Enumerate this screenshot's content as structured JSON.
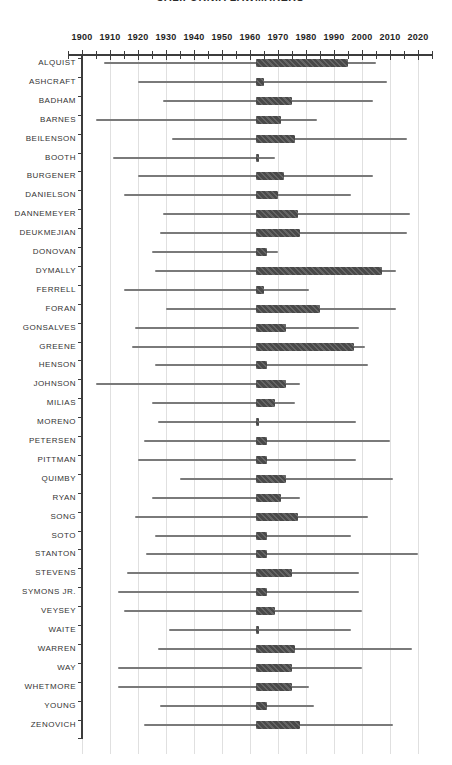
{
  "title": "CALIFORNIA LAWMAKERS",
  "chart_data": {
    "type": "bar",
    "subtype": "horizontal-range-timeline",
    "title": "CALIFORNIA LAWMAKERS",
    "title_clipped_at_top": true,
    "xlabel": "",
    "ylabel": "",
    "legend_position": "none",
    "grid": "vertical gridlines at each decade",
    "x_axis": {
      "min": 1895,
      "max": 2025,
      "minor_tick_step": 5,
      "major_tick_step": 10,
      "tick_labels": [
        "1900",
        "1910",
        "1920",
        "1930",
        "1940",
        "1950",
        "1960",
        "1970",
        "1980",
        "1990",
        "2000",
        "2010",
        "2020"
      ]
    },
    "series_meaning": [
      {
        "name": "lifespan",
        "style": "thin-gray-line"
      },
      {
        "name": "tenure",
        "style": "thick-dark-bar"
      }
    ],
    "colors": {
      "tenure_bar": "#4d4d4d",
      "lifespan_line": "#7a7a7a",
      "gridline": "#e0e0e0",
      "axis": "#3c3c3c",
      "row_label": "#333333",
      "background": "#ffffff"
    },
    "rows": [
      {
        "name": "ALQUIST",
        "lifespan": [
          1908,
          2005
        ],
        "tenure": [
          1962,
          1995
        ]
      },
      {
        "name": "ASHCRAFT",
        "lifespan": [
          1920,
          2009
        ],
        "tenure": [
          1962,
          1965
        ]
      },
      {
        "name": "BADHAM",
        "lifespan": [
          1929,
          2004
        ],
        "tenure": [
          1962,
          1975
        ]
      },
      {
        "name": "BARNES",
        "lifespan": [
          1905,
          1984
        ],
        "tenure": [
          1962,
          1971
        ]
      },
      {
        "name": "BEILENSON",
        "lifespan": [
          1932,
          2016
        ],
        "tenure": [
          1962,
          1976
        ]
      },
      {
        "name": "BOOTH",
        "lifespan": [
          1911,
          1969
        ],
        "tenure": [
          1962,
          1963
        ]
      },
      {
        "name": "BURGENER",
        "lifespan": [
          1920,
          2004
        ],
        "tenure": [
          1962,
          1972
        ]
      },
      {
        "name": "DANIELSON",
        "lifespan": [
          1915,
          1996
        ],
        "tenure": [
          1962,
          1970
        ]
      },
      {
        "name": "DANNEMEYER",
        "lifespan": [
          1929,
          2017
        ],
        "tenure": [
          1962,
          1977
        ]
      },
      {
        "name": "DEUKMEJIAN",
        "lifespan": [
          1928,
          2016
        ],
        "tenure": [
          1962,
          1978
        ]
      },
      {
        "name": "DONOVAN",
        "lifespan": [
          1925,
          1970
        ],
        "tenure": [
          1962,
          1966
        ]
      },
      {
        "name": "DYMALLY",
        "lifespan": [
          1926,
          2012
        ],
        "tenure": [
          1962,
          2007
        ]
      },
      {
        "name": "FERRELL",
        "lifespan": [
          1915,
          1981
        ],
        "tenure": [
          1962,
          1965
        ]
      },
      {
        "name": "FORAN",
        "lifespan": [
          1930,
          2012
        ],
        "tenure": [
          1962,
          1985
        ]
      },
      {
        "name": "GONSALVES",
        "lifespan": [
          1919,
          1999
        ],
        "tenure": [
          1962,
          1973
        ]
      },
      {
        "name": "GREENE",
        "lifespan": [
          1918,
          2001
        ],
        "tenure": [
          1962,
          1997
        ]
      },
      {
        "name": "HENSON",
        "lifespan": [
          1926,
          2002
        ],
        "tenure": [
          1962,
          1966
        ]
      },
      {
        "name": "JOHNSON",
        "lifespan": [
          1905,
          1978
        ],
        "tenure": [
          1962,
          1973
        ]
      },
      {
        "name": "MILIAS",
        "lifespan": [
          1925,
          1976
        ],
        "tenure": [
          1962,
          1969
        ]
      },
      {
        "name": "MORENO",
        "lifespan": [
          1927,
          1998
        ],
        "tenure": [
          1962,
          1963
        ]
      },
      {
        "name": "PETERSEN",
        "lifespan": [
          1922,
          2010
        ],
        "tenure": [
          1962,
          1966
        ]
      },
      {
        "name": "PITTMAN",
        "lifespan": [
          1920,
          1998
        ],
        "tenure": [
          1962,
          1966
        ]
      },
      {
        "name": "QUIMBY",
        "lifespan": [
          1935,
          2011
        ],
        "tenure": [
          1962,
          1973
        ]
      },
      {
        "name": "RYAN",
        "lifespan": [
          1925,
          1978
        ],
        "tenure": [
          1962,
          1971
        ]
      },
      {
        "name": "SONG",
        "lifespan": [
          1919,
          2002
        ],
        "tenure": [
          1962,
          1977
        ]
      },
      {
        "name": "SOTO",
        "lifespan": [
          1926,
          1996
        ],
        "tenure": [
          1962,
          1966
        ]
      },
      {
        "name": "STANTON",
        "lifespan": [
          1923,
          2020
        ],
        "tenure": [
          1962,
          1966
        ]
      },
      {
        "name": "STEVENS",
        "lifespan": [
          1916,
          1999
        ],
        "tenure": [
          1962,
          1975
        ]
      },
      {
        "name": "SYMONS JR.",
        "lifespan": [
          1913,
          1999
        ],
        "tenure": [
          1962,
          1966
        ]
      },
      {
        "name": "VEYSEY",
        "lifespan": [
          1915,
          2000
        ],
        "tenure": [
          1962,
          1969
        ]
      },
      {
        "name": "WAITE",
        "lifespan": [
          1931,
          1996
        ],
        "tenure": [
          1962,
          1963
        ]
      },
      {
        "name": "WARREN",
        "lifespan": [
          1927,
          2018
        ],
        "tenure": [
          1962,
          1976
        ]
      },
      {
        "name": "WAY",
        "lifespan": [
          1913,
          2000
        ],
        "tenure": [
          1962,
          1975
        ]
      },
      {
        "name": "WHETMORE",
        "lifespan": [
          1913,
          1981
        ],
        "tenure": [
          1962,
          1975
        ]
      },
      {
        "name": "YOUNG",
        "lifespan": [
          1928,
          1983
        ],
        "tenure": [
          1962,
          1966
        ]
      },
      {
        "name": "ZENOVICH",
        "lifespan": [
          1922,
          2011
        ],
        "tenure": [
          1962,
          1978
        ]
      }
    ]
  }
}
